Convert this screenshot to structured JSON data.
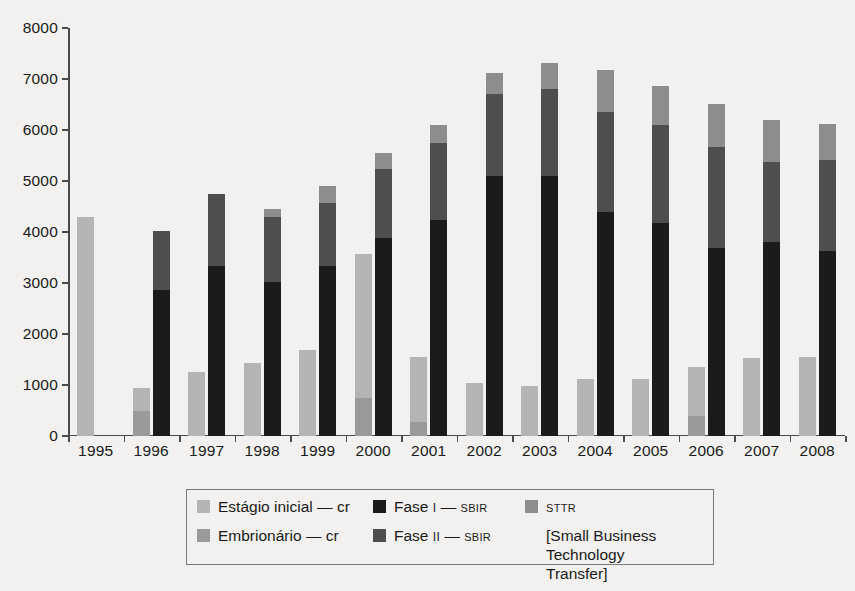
{
  "chart_data": {
    "type": "bar",
    "title": "",
    "subtitle": "",
    "xlabel": "",
    "ylabel": "",
    "ylim": [
      0,
      8000
    ],
    "ytick_step": 1000,
    "yticks": [
      0,
      1000,
      2000,
      3000,
      4000,
      5000,
      6000,
      7000,
      8000
    ],
    "grid": false,
    "stacked": true,
    "legend_position": "bottom-center",
    "categories": [
      "1995",
      "1996",
      "1997",
      "1998",
      "1999",
      "2000",
      "2001",
      "2002",
      "2003",
      "2004",
      "2005",
      "2006",
      "2007",
      "2008"
    ],
    "bar_groups": [
      {
        "name": "capital-de-risco",
        "description": "Capital de risco (venture capital) bar — left bar in each year group",
        "segments": [
          {
            "name": "Embrionário — cr",
            "color": "#9a9a9a",
            "values": [
              0,
              500,
              0,
              0,
              0,
              750,
              280,
              0,
              0,
              0,
              0,
              400,
              0,
              0
            ]
          },
          {
            "name": "Estágio inicial — cr",
            "color": "#b4b4b4",
            "values": [
              4300,
              440,
              1250,
              1430,
              1680,
              2810,
              1270,
              1040,
              990,
              1110,
              1110,
              950,
              1530,
              1540
            ]
          }
        ],
        "totals": [
          4300,
          940,
          1250,
          1430,
          1680,
          3560,
          1550,
          1040,
          990,
          1110,
          1110,
          1350,
          1530,
          1540
        ]
      },
      {
        "name": "sbir-sttr",
        "description": "SBIR/STTR bar — right bar in each year group",
        "segments": [
          {
            "name": "Fase I — SBIR",
            "color": "#1b1b1b",
            "values": [
              0,
              2870,
              3340,
              3020,
              3330,
              3890,
              4230,
              5100,
              5100,
              4390,
              4180,
              3680,
              3800,
              3630
            ]
          },
          {
            "name": "Fase II — SBIR",
            "color": "#4e4e4e",
            "values": [
              0,
              1150,
              1400,
              1270,
              1230,
              1350,
              1520,
              1610,
              1710,
              1970,
              1910,
              1990,
              1570,
              1780
            ]
          },
          {
            "name": "STTR",
            "color": "#8d8d8d",
            "values": [
              0,
              0,
              0,
              160,
              340,
              310,
              340,
              400,
              500,
              820,
              770,
              840,
              820,
              700
            ]
          }
        ],
        "totals": [
          0,
          4020,
          4740,
          4450,
          4900,
          5550,
          6090,
          7110,
          7310,
          7180,
          6860,
          6510,
          6190,
          6110
        ]
      }
    ]
  },
  "yaxis": {
    "labels": [
      "8000",
      "7000",
      "6000",
      "5000",
      "4000",
      "3000",
      "2000",
      "1000",
      "0"
    ]
  },
  "xaxis": {
    "labels": [
      "1995",
      "1996",
      "1997",
      "1998",
      "1999",
      "2000",
      "2001",
      "2002",
      "2003",
      "2004",
      "2005",
      "2006",
      "2007",
      "2008"
    ]
  },
  "legend": {
    "items": [
      {
        "id": "estagio-inicial",
        "label": "Estágio inicial",
        "dash": "—",
        "suffix": "cr",
        "suffix_small": false,
        "color": "#b4b4b4"
      },
      {
        "id": "fase-i",
        "label": "Fase",
        "roman": "I",
        "dash": "—",
        "suffix": "SBIR",
        "suffix_small": true,
        "color": "#1b1b1b"
      },
      {
        "id": "sttr",
        "label": "",
        "suffix": "STTR",
        "suffix_small": true,
        "color": "#8d8d8d"
      },
      {
        "id": "embrionario",
        "label": "Embrionário",
        "dash": "—",
        "suffix": "cr",
        "suffix_small": false,
        "color": "#9a9a9a"
      },
      {
        "id": "fase-ii",
        "label": "Fase",
        "roman": "II",
        "dash": "—",
        "suffix": "SBIR",
        "suffix_small": true,
        "color": "#4e4e4e"
      }
    ],
    "estagio_inicial_label": "Estágio inicial",
    "estagio_inicial_suffix": "cr",
    "embrionario_label": "Embrionário",
    "embrionario_suffix": "cr",
    "fase_label": "Fase",
    "fase_i_roman": "I",
    "fase_ii_roman": "II",
    "sbir_suffix": "SBIR",
    "dash": "—",
    "sttr_label": "STTR",
    "sttr_note": "[Small Business\nTechnology Transfer]"
  },
  "colors": {
    "estagio_inicial": "#b4b4b4",
    "embrionario": "#9a9a9a",
    "fase_i": "#1b1b1b",
    "fase_ii": "#4e4e4e",
    "sttr": "#8d8d8d",
    "axis": "#4a4a4a",
    "background": "#f2f1ef",
    "text": "#1a1a1a"
  }
}
